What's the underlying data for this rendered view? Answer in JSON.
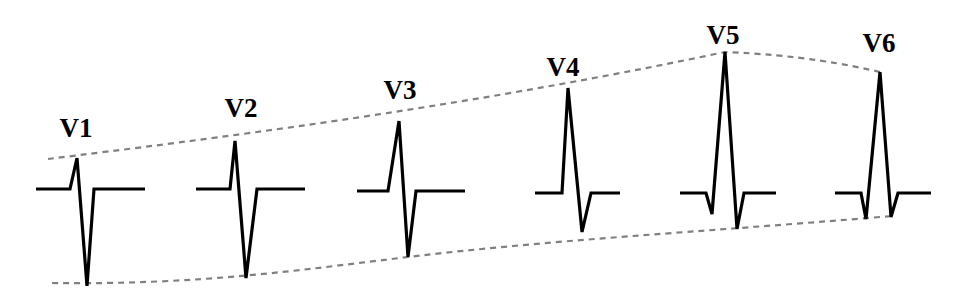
{
  "diagram": {
    "title": "",
    "colors": {
      "trace": "#000000",
      "envelope": "#808080",
      "background": "#ffffff"
    },
    "leads": [
      {
        "label": "V1",
        "label_x": 76,
        "label_y": 137,
        "points": "36,189 70,189 77,158 87,286 94,189 145,189"
      },
      {
        "label": "V2",
        "label_x": 241,
        "label_y": 117,
        "points": "196,189 230,189 235,141 246,278 257,189 305,189"
      },
      {
        "label": "V3",
        "label_x": 400,
        "label_y": 99,
        "points": "357,191 388,191 399,121 408,257 416,191 465,191"
      },
      {
        "label": "V4",
        "label_x": 563,
        "label_y": 76,
        "points": "535,193 562,193 568,88 582,232 591,193 620,193"
      },
      {
        "label": "V5",
        "label_x": 723,
        "label_y": 44,
        "points": "680,193 706,193 712,214 725,52 737,229 744,193 776,193"
      },
      {
        "label": "V6",
        "label_x": 879,
        "label_y": 52,
        "points": "835,193 861,193 866,219 880,72 891,217 898,193 931,193"
      }
    ],
    "envelopes": [
      {
        "name": "r-wave-envelope",
        "path": "M 48 159 C 200 140, 450 110, 725 52 C 800 55, 850 65, 880 72"
      },
      {
        "name": "s-wave-envelope",
        "path": "M 52 283 C 200 285, 300 270, 408 257 C 550 240, 700 232, 880 217 L 895 216"
      }
    ]
  }
}
